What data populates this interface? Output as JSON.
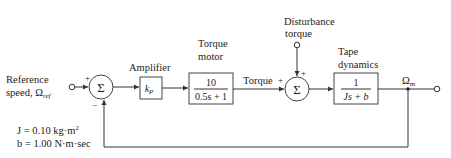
{
  "diagram": {
    "type": "block_diagram",
    "input": {
      "label_line1": "Reference",
      "label_line2": "speed, Ω",
      "label_sub": "ref"
    },
    "sum1": {
      "symbol": "Σ",
      "plus_sign": "+",
      "minus_sign": "−"
    },
    "amplifier": {
      "title": "Amplifier",
      "gain": "k",
      "gain_sub": "P"
    },
    "motor": {
      "title_line1": "Torque",
      "title_line2": "motor",
      "numerator": "10",
      "denominator": "0.5s + 1"
    },
    "torque_label": "Torque",
    "disturbance": {
      "label_line1": "Disturbance",
      "label_line2": "torque"
    },
    "sum2": {
      "symbol": "Σ",
      "plus_left": "+",
      "plus_top": "+"
    },
    "tape": {
      "title_line1": "Tape",
      "title_line2": "dynamics",
      "numerator": "1",
      "denominator": "Js + b"
    },
    "output": {
      "label": "Ω",
      "label_sub": "m"
    },
    "parameters": {
      "J": "J = 0.10 kg·m",
      "J_exp": "2",
      "b": "b = 1.00 N·m·sec"
    },
    "colors": {
      "line": "#333333",
      "text": "#222222",
      "background": "#ffffff"
    }
  }
}
